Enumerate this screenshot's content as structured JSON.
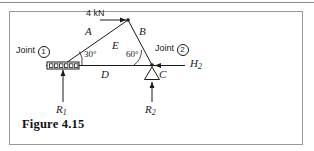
{
  "figure": {
    "caption": "Figure 4.15",
    "kind": "statics-truss-free-body-diagram"
  },
  "labels": {
    "load": "4 kN",
    "member_a": "A",
    "member_b": "B",
    "member_c": "C",
    "member_d": "D",
    "member_e": "E",
    "joint_left_text": "Joint",
    "joint_left_number": "1",
    "joint_right_text": "Joint",
    "joint_right_number": "2",
    "angle_left": "30°",
    "angle_right": "60°",
    "reaction_left": "R",
    "reaction_left_sub": "1",
    "reaction_right": "R",
    "reaction_right_sub": "2",
    "horizontal_force": "H",
    "horizontal_force_sub": "2"
  },
  "geometry": {
    "node_left": [
      63,
      65
    ],
    "node_apex": [
      128,
      20
    ],
    "node_right": [
      152,
      65
    ],
    "left_support": "roller",
    "right_support": "pin"
  },
  "colors": {
    "ink": "#1a1a1a",
    "frame": "#9a9a9a",
    "rule": "#8a8a8a",
    "background": "#ffffff"
  }
}
